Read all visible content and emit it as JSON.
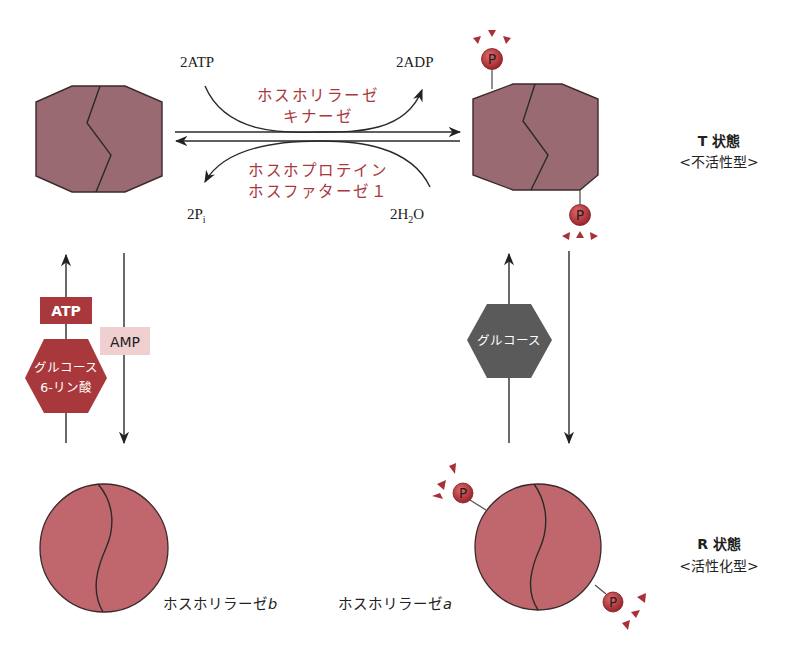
{
  "colors": {
    "t_state_fill": "#9a6a72",
    "r_state_fill": "#c0676d",
    "outline": "#3a2a2c",
    "enzyme_red_text": "#a8383c",
    "atp_box": "#a8383c",
    "amp_box": "#efcfcf",
    "g6p_hex": "#a8383c",
    "glucose_hex": "#5a5a5a",
    "phosphate": "#b8343a",
    "spark": "#a8303a"
  },
  "reaction": {
    "forward_input": "2ATP",
    "forward_output": "2ADP",
    "forward_enzyme_line1": "ホスホリラーゼ",
    "forward_enzyme_line2": "キナーゼ",
    "reverse_input": "2H",
    "reverse_input_sub": "2",
    "reverse_input_tail": "O",
    "reverse_output": "2P",
    "reverse_output_sub": "i",
    "reverse_enzyme_line1": "ホスホプロテイン",
    "reverse_enzyme_line2": "ホスファターゼ１"
  },
  "states": {
    "t_state_label": "T 状態",
    "t_state_sub": "<不活性型>",
    "r_state_label": "R 状態",
    "r_state_sub": "<活性化型>"
  },
  "modulators": {
    "atp": "ATP",
    "amp": "AMP",
    "g6p_line1": "グルコース",
    "g6p_line2": "6-リン酸",
    "glucose": "グルコース"
  },
  "enzymes": {
    "phosphorylase_b": "ホスホリラーゼ",
    "phosphorylase_b_suffix": "b",
    "phosphorylase_a": "ホスホリラーゼ",
    "phosphorylase_a_suffix": "a"
  },
  "phosphate_label": "P"
}
